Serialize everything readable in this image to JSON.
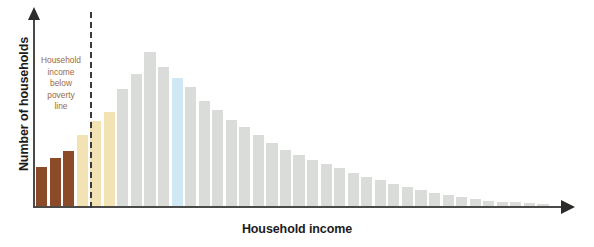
{
  "chart_data": {
    "type": "bar",
    "title": "",
    "subtitle": "",
    "xlabel": "Household income",
    "ylabel": "Number of households",
    "grid": false,
    "legend": null,
    "axis_ticks": {
      "x": [],
      "y": []
    },
    "axis_style": "arrow-ended axes, no tick marks, no numeric scale",
    "annotations": [
      {
        "name": "poverty-line-label",
        "text_lines": [
          "Household",
          "income",
          "below",
          "poverty",
          "line"
        ],
        "color": "#9a6a43",
        "position": "left of dashed threshold line"
      },
      {
        "name": "poverty-threshold",
        "style": "vertical dashed line",
        "color": "#3a3a36",
        "after_category_index": 2
      }
    ],
    "categories": [
      "b1",
      "b2",
      "b3",
      "b4",
      "b5",
      "b6",
      "b7",
      "b8",
      "b9",
      "b10",
      "b11",
      "b12",
      "b13",
      "b14",
      "b15",
      "b16",
      "b17",
      "b18",
      "b19",
      "b20",
      "b21",
      "b22",
      "b23",
      "b24",
      "b25",
      "b26",
      "b27",
      "b28",
      "b29",
      "b30",
      "b31",
      "b32",
      "b33",
      "b34",
      "b35",
      "b36",
      "b37",
      "b38"
    ],
    "values": [
      44,
      54,
      62,
      79,
      95,
      105,
      131,
      148,
      172,
      156,
      143,
      133,
      118,
      107,
      96,
      88,
      79,
      71,
      63,
      57,
      52,
      47,
      42,
      37,
      33,
      29,
      25,
      21,
      18,
      15,
      12,
      10,
      8,
      6,
      5,
      4,
      3,
      2
    ],
    "ylim": [
      0,
      188
    ],
    "bar_colors": [
      "#8B4A28",
      "#8B4A28",
      "#8B4A28",
      "#F2E2B4",
      "#F2E2B4",
      "#F2E2B4",
      "#D9DCD9",
      "#D9DCD9",
      "#D9DCD9",
      "#D9DCD9",
      "#CFE8F4",
      "#D9DCD9",
      "#D9DCD9",
      "#D9DCD9",
      "#D9DCD9",
      "#D9DCD9",
      "#D9DCD9",
      "#D9DCD9",
      "#D9DCD9",
      "#D9DCD9",
      "#D9DCD9",
      "#D9DCD9",
      "#D9DCD9",
      "#D9DCD9",
      "#D9DCD9",
      "#D9DCD9",
      "#D9DCD9",
      "#D9DCD9",
      "#D9DCD9",
      "#D9DCD9",
      "#D9DCD9",
      "#D9DCD9",
      "#D9DCD9",
      "#D9DCD9",
      "#D9DCD9",
      "#D9DCD9",
      "#D9DCD9",
      "#D9DCD9"
    ],
    "color_key": {
      "below_poverty": "#8B4A28",
      "near_poverty": "#F2E2B4",
      "median_highlight": "#CFE8F4",
      "default": "#D9DCD9"
    },
    "geometry": {
      "plot_left": 36,
      "baseline_y": 206,
      "bar_pitch": 13.55,
      "bar_width": 11.2
    }
  },
  "axis": {
    "y_title": "Number of households",
    "x_title": "Household income"
  },
  "annotation": {
    "line1": "Household",
    "line2": "income",
    "line3": "below",
    "line4": "poverty",
    "line5": "line"
  }
}
